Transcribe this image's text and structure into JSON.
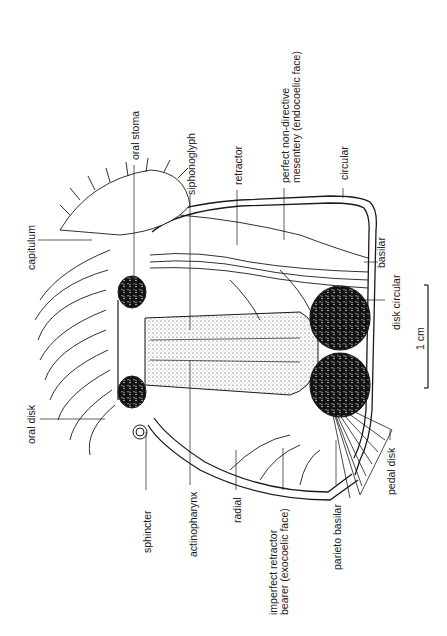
{
  "figure": {
    "orientation": "rotated 90 degrees counter-clockwise",
    "scale_bar": {
      "label": "1 cm"
    }
  },
  "labels": {
    "oral_stoma": "oral stoma",
    "siphonoglyph": "siphonoglyph",
    "retractor": "retractor",
    "perfect_mesentery_line1": "perfect non-directive",
    "perfect_mesentery_line2": "mesentery (endocoelic face)",
    "circular": "circular",
    "capitulum": "capitulum",
    "basilar": "basilar",
    "disk_circular": "disk circular",
    "oral_disk": "oral disk",
    "sphincter": "sphincter",
    "actinopharynx": "actinopharynx",
    "radial": "radial",
    "imperfect_retractor_line1": "imperfect retractor",
    "imperfect_retractor_line2": "bearer (exocoelic face)",
    "parieto_basilar": "parieto basilar",
    "pedal_disk": "pedal disk"
  },
  "colors": {
    "ink": "#1a1a1a",
    "background": "#ffffff",
    "stipple": "#555555"
  }
}
